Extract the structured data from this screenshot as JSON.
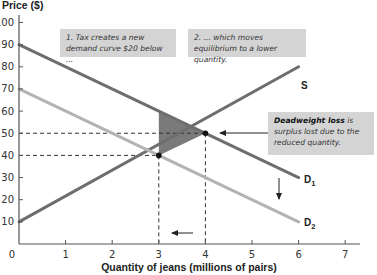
{
  "chart_data": {
    "type": "line",
    "title": "",
    "xlabel": "Quantity of jeans (millions of pairs)",
    "ylabel": "Price ($)",
    "xlim": [
      0,
      7
    ],
    "ylim": [
      0,
      100
    ],
    "x_ticks": [
      "0",
      "1",
      "2",
      "3",
      "4",
      "5",
      "6",
      "7"
    ],
    "y_ticks": [
      "10",
      "20",
      "30",
      "40",
      "50",
      "60",
      "70",
      "80",
      "90",
      "100"
    ],
    "grid": false,
    "series": [
      {
        "name": "S",
        "x": [
          0,
          6
        ],
        "y": [
          10,
          80
        ],
        "color": "#6e6e6e"
      },
      {
        "name": "D1",
        "x": [
          0,
          6
        ],
        "y": [
          90,
          30
        ],
        "color": "#6e6e6e"
      },
      {
        "name": "D2",
        "x": [
          0,
          6
        ],
        "y": [
          70,
          10
        ],
        "color": "#b3b3b3"
      }
    ],
    "points": [
      {
        "label": "original equilibrium",
        "x": 4,
        "y": 50
      },
      {
        "label": "new equilibrium",
        "x": 3,
        "y": 40
      }
    ],
    "shaded_region": {
      "name": "Deadweight loss",
      "vertices": [
        [
          3,
          60
        ],
        [
          3,
          40
        ],
        [
          4,
          50
        ]
      ],
      "color": "#7a7a7a"
    },
    "annotations": [
      "1. Tax creates a new demand curve $20 below ...",
      "2. ... which moves equilibrium to a lower quantity.",
      "Deadweight loss is surplus lost due to the reduced quantity."
    ]
  },
  "labels": {
    "y_axis_title": "Price ($)",
    "x_axis_title": "Quantity of jeans (millions of pairs)",
    "origin": "0",
    "supply": "S",
    "demand1_main": "D",
    "demand1_sub": "1",
    "demand2_main": "D",
    "demand2_sub": "2"
  },
  "callouts": {
    "one": "1. Tax creates a new demand curve $20 below ...",
    "two": "2. ... which moves equilibrium to a lower quantity.",
    "three_bold": "Deadweight loss",
    "three_rest": " is surplus lost due to the reduced quantity."
  }
}
